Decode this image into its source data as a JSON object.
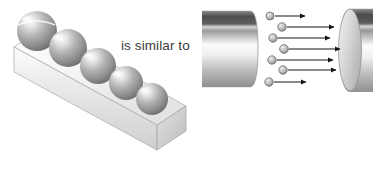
{
  "figure": {
    "title": "",
    "caption_text": "is similar to",
    "background_color": "#ffffff"
  },
  "left_diagram": {
    "name": "spheres-on-bar",
    "description": "Row of five gray spheres resting on top of a long diagonal rectangular bar",
    "bar": {
      "label": "",
      "top_face_color": "#f2f2f2",
      "front_face_color": "#dcdcdc",
      "end_face_color": "#c9c9c9",
      "outline_color": "#9a9a9a"
    },
    "spheres": {
      "count": 5,
      "base_color": "#8e8e8e",
      "highlight_color": "#f5f5f5",
      "shadow_color": "#5f5f5f",
      "items": [
        {
          "label": "",
          "cx": 37,
          "cy": 31,
          "r": 20
        },
        {
          "label": "",
          "cx": 68,
          "cy": 48,
          "r": 19
        },
        {
          "label": "",
          "cx": 98,
          "cy": 66,
          "r": 18
        },
        {
          "label": "",
          "cx": 126,
          "cy": 83,
          "r": 17
        },
        {
          "label": "",
          "cx": 152,
          "cy": 99,
          "r": 16
        }
      ]
    }
  },
  "right_diagram": {
    "name": "cylinders-with-particles",
    "description": "Two gray cylinders with small particles travelling on arrows from the left cylinder to the right cylinder",
    "left_cylinder": {
      "label": "",
      "body_color_dark": "#5d5d5d",
      "body_color_light": "#fbfbfb",
      "outline_color": "#8f8f8f"
    },
    "right_cylinder": {
      "label": "",
      "face_color": "#d8d8d8",
      "body_color_dark": "#5a5a5a",
      "body_color_light": "#fcfcfc",
      "outline_color": "#8f8f8f"
    },
    "particles": {
      "count": 7,
      "fill_color": "#b8b8b8",
      "stroke_color": "#6e6e6e",
      "arrow_color": "#1a1a1a",
      "items": [
        {
          "label": "",
          "cx": 70,
          "cy": 16,
          "r": 4.0,
          "arrow_from": 75,
          "arrow_to": 105,
          "arrow_y": 16
        },
        {
          "label": "",
          "cx": 82,
          "cy": 27,
          "r": 4.2,
          "arrow_from": 87,
          "arrow_to": 134,
          "arrow_y": 27
        },
        {
          "label": "",
          "cx": 73,
          "cy": 38,
          "r": 4.2,
          "arrow_from": 78,
          "arrow_to": 130,
          "arrow_y": 38
        },
        {
          "label": "",
          "cx": 84,
          "cy": 49,
          "r": 4.4,
          "arrow_from": 89,
          "arrow_to": 140,
          "arrow_y": 49
        },
        {
          "label": "",
          "cx": 72,
          "cy": 60,
          "r": 4.2,
          "arrow_from": 77,
          "arrow_to": 133,
          "arrow_y": 60
        },
        {
          "label": "",
          "cx": 83,
          "cy": 70,
          "r": 4.2,
          "arrow_from": 88,
          "arrow_to": 136,
          "arrow_y": 70
        },
        {
          "label": "",
          "cx": 69,
          "cy": 82,
          "r": 4.2,
          "arrow_from": 74,
          "arrow_to": 106,
          "arrow_y": 82
        }
      ]
    }
  }
}
